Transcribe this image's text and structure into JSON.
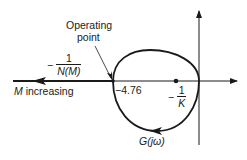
{
  "diagram": {
    "type": "describing-function-nyquist-plot",
    "labels": {
      "operating_point_line1": "Operating",
      "operating_point_line2": "point",
      "neg_inv_N_minus": "−",
      "neg_inv_N_num": "1",
      "neg_inv_N_den": "N(M)",
      "m_increasing_var": "M",
      "m_increasing_text": " increasing",
      "intercept_value": "−4.76",
      "neg_inv_K_minus": "−",
      "neg_inv_K_num": "1",
      "neg_inv_K_den": "K",
      "g_jw": "G(jω)"
    },
    "elements": {
      "real_axis": {
        "x1": 13,
        "x2": 238,
        "y": 81
      },
      "imag_axis": {
        "x": 199,
        "y1": 10,
        "y2": 145
      },
      "operating_point": {
        "x": 113,
        "y": 81,
        "value": -4.76
      },
      "inv_K_point": {
        "x": 176,
        "y": 81
      },
      "loop_direction": "counterclockwise-at-bottom (arrow pointing left)",
      "locus_direction": "left (M increasing)"
    },
    "colors": {
      "line": "#1a1a1a",
      "background": "#ffffff"
    }
  }
}
